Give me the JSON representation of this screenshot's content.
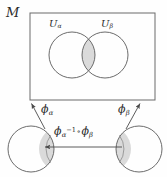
{
  "figure": {
    "background_color": "#fefefe",
    "stroke_color": "#4a4a4a",
    "text_color": "#2b2b2b",
    "overlap_fill_color": "#d9d9d9",
    "width": 167,
    "height": 177
  },
  "labels": {
    "manifold": "M",
    "chart_alpha": "U",
    "chart_alpha_sub": "α",
    "chart_beta": "U",
    "chart_beta_sub": "β",
    "map_alpha": "ϕ",
    "map_alpha_sub": "α",
    "map_beta": "ϕ",
    "map_beta_sub": "β",
    "transition_first": "ϕ",
    "transition_first_sub": "α",
    "transition_first_sup": "−1",
    "transition_operator": "∘",
    "transition_second": "ϕ",
    "transition_second_sub": "β"
  },
  "geometry": {
    "manifold_box": {
      "x": 30,
      "y": 13,
      "width": 125,
      "height": 87
    },
    "chart_circle_alpha": {
      "cx": 72,
      "cy": 55,
      "r": 23
    },
    "chart_circle_beta": {
      "cx": 105,
      "cy": 55,
      "r": 23
    },
    "domain_circle_alpha": {
      "cx": 31,
      "cy": 149,
      "r": 23
    },
    "domain_circle_beta": {
      "cx": 139,
      "cy": 149,
      "r": 23
    },
    "arrow_alpha": {
      "x1": 45,
      "y1": 129,
      "x2": 31,
      "y2": 103
    },
    "arrow_beta": {
      "x1": 127,
      "y1": 129,
      "x2": 141,
      "y2": 103
    },
    "arrow_transition": {
      "x1": 122,
      "y1": 147,
      "x2": 45,
      "y2": 147
    }
  }
}
